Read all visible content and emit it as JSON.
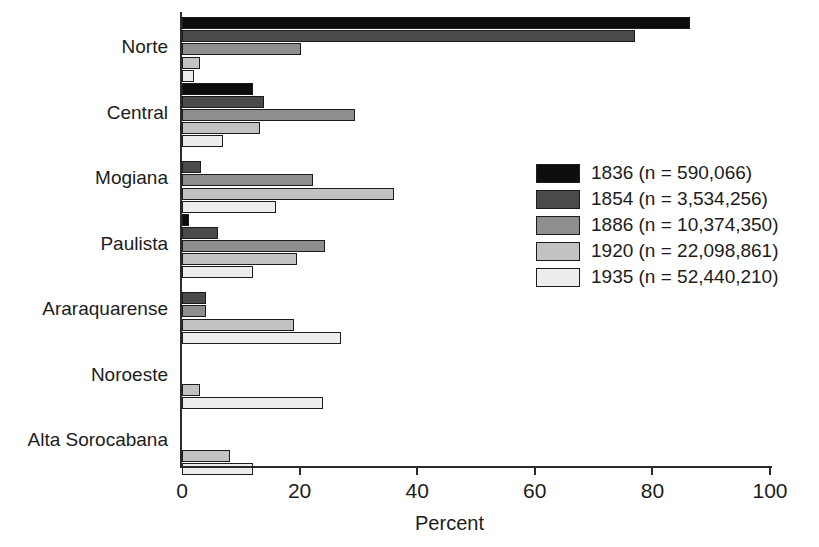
{
  "chart_data": {
    "type": "bar",
    "orientation": "horizontal",
    "title": "",
    "xlabel": "Percent",
    "ylabel": "",
    "xlim": [
      0,
      100
    ],
    "xticks": [
      0,
      20,
      40,
      60,
      80,
      100
    ],
    "xtick_labels": [
      "0",
      "20",
      "40",
      "60",
      "80",
      "100"
    ],
    "grid": false,
    "legend_position": "right-center",
    "categories": [
      "Norte",
      "Central",
      "Mogiana",
      "Paulista",
      "Araraquarense",
      "Noroeste",
      "Alta Sorocabana"
    ],
    "series": [
      {
        "name": "1836 (n = 590,066)",
        "year": "1836",
        "n": "590,066",
        "color": "#0d0d0d",
        "values": [
          86.4,
          12.0,
          0.0,
          1.2,
          0.0,
          0.0,
          0.0
        ]
      },
      {
        "name": "1854 (n = 3,534,256)",
        "year": "1854",
        "n": "3,534,256",
        "color": "#4a4a4a",
        "values": [
          77.0,
          14.0,
          3.2,
          6.2,
          4.0,
          0.0,
          0.0
        ]
      },
      {
        "name": "1886 (n = 10,374,350)",
        "year": "1886",
        "n": "10,374,350",
        "color": "#8e8e8e",
        "values": [
          20.2,
          29.4,
          22.2,
          24.3,
          4.0,
          0.0,
          0.0
        ]
      },
      {
        "name": "1920 (n = 22,098,861)",
        "year": "1920",
        "n": "22,098,861",
        "color": "#c2c2c2",
        "values": [
          3.0,
          13.2,
          36.0,
          19.6,
          19.0,
          3.0,
          8.2
        ]
      },
      {
        "name": "1935 (n = 52,440,210)",
        "year": "1935",
        "n": "52,440,210",
        "color": "#ededed",
        "values": [
          2.0,
          7.0,
          16.0,
          12.0,
          27.0,
          24.0,
          12.0
        ]
      }
    ]
  },
  "axis": {
    "x_title": "Percent"
  }
}
